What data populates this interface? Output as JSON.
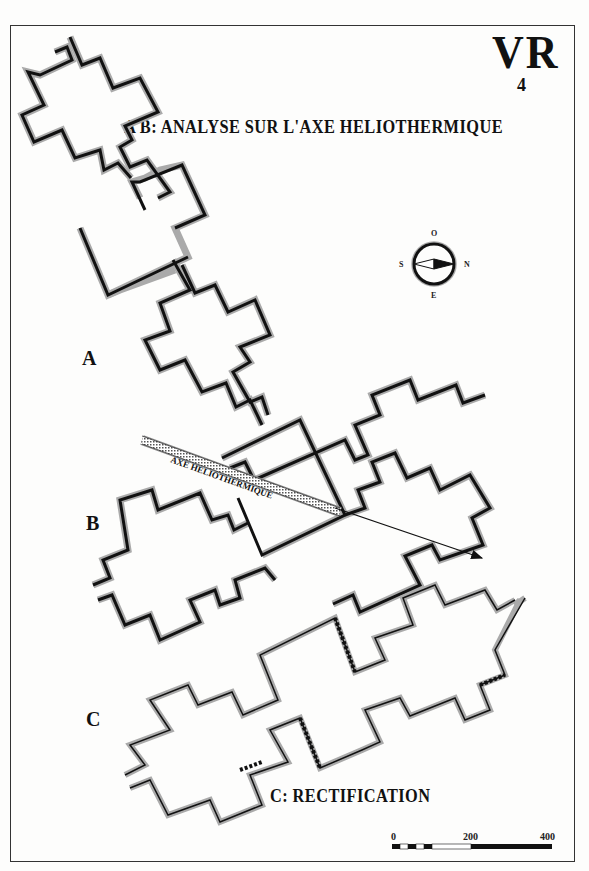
{
  "plate": {
    "id": "VR",
    "number": "4",
    "title": "A B: ANALYSE SUR L'AXE HELIOTHERMIQUE",
    "subtitle": "C: RECTIFICATION"
  },
  "sections": [
    {
      "label": "A"
    },
    {
      "label": "B"
    },
    {
      "label": "C"
    }
  ],
  "axis": {
    "label": "AXE HELIOTHERMIQUE"
  },
  "compass": {
    "top": "O",
    "bottom": "E",
    "left": "S",
    "right": "N"
  },
  "scale_bar": {
    "ticks": [
      "0",
      "200",
      "400"
    ]
  },
  "colors": {
    "ink": "#111111",
    "paper": "#fdfdfc",
    "hatch": "#888888"
  }
}
